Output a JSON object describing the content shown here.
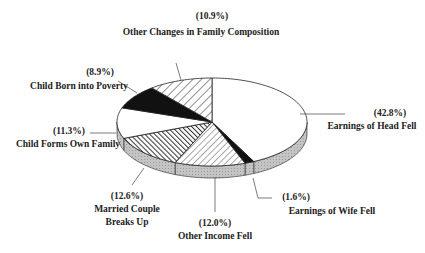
{
  "chart_data": {
    "type": "pie",
    "style": "3d-exploded-none",
    "title": "",
    "start": "top",
    "direction": "clockwise",
    "slices": [
      {
        "label": "Earnings of Head Fell",
        "pct_label": "(42.8%)",
        "value": 42.8,
        "fill": "white"
      },
      {
        "label": "Earnings of Wife Fell",
        "pct_label": "(1.6%)",
        "value": 1.6,
        "fill": "black"
      },
      {
        "label": "Other Income Fell",
        "pct_label": "(12.0%)",
        "value": 12.0,
        "fill": "light-hatch"
      },
      {
        "label": "Married Couple Breaks Up",
        "label_lines": [
          "Married Couple",
          "Breaks Up"
        ],
        "pct_label": "(12.6%)",
        "value": 12.6,
        "fill": "dark-hatch"
      },
      {
        "label": "Child Forms Own Family",
        "pct_label": "(11.3%)",
        "value": 11.3,
        "fill": "white"
      },
      {
        "label": "Child Born into Poverty",
        "pct_label": "(8.9%)",
        "value": 8.9,
        "fill": "black"
      },
      {
        "label": "Other Changes in Family Composition",
        "pct_label": "(10.9%)",
        "value": 10.9,
        "fill": "hatch"
      }
    ],
    "colors": {
      "outline": "#222222",
      "black": "#111111",
      "side": "#bdbdbd",
      "hatch": "#333333"
    }
  }
}
